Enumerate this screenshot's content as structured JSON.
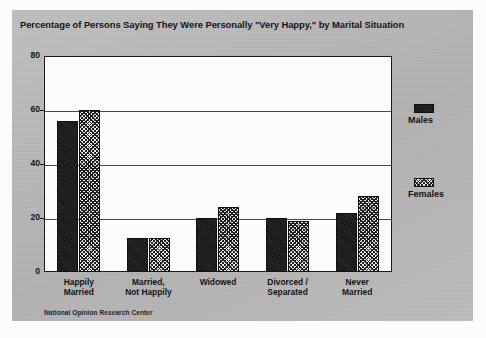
{
  "chart_data": {
    "type": "bar",
    "title": "Percentage of Persons Saying They Were Personally \"Very Happy,\" by Marital Situation",
    "xlabel": "",
    "ylabel": "",
    "ylim": [
      0,
      80
    ],
    "yticks": [
      "0",
      "20",
      "40",
      "60",
      "80"
    ],
    "ytick_values": [
      0,
      20,
      40,
      60,
      80
    ],
    "grid": true,
    "grid_axis": "y",
    "legend_position": "right",
    "categories": [
      "Happily\nMarried",
      "Married,\nNot Happily",
      "Widowed",
      "Divorced /\nSeparated",
      "Never\nMarried"
    ],
    "series": [
      {
        "name": "Males",
        "color": "#1b1b1b",
        "pattern": "solid",
        "values": [
          56,
          12.5,
          20,
          20,
          22
        ]
      },
      {
        "name": "Females",
        "color": "#ededed",
        "pattern": "hatched",
        "values": [
          60,
          12.5,
          24,
          19,
          28
        ]
      }
    ],
    "annotations": [
      "National Opinion Research Center"
    ]
  },
  "figure": {
    "title": "Percentage of Persons Saying They Were Personally \"Very Happy,\" by Marital Situation",
    "source_note": "National Opinion Research Center",
    "panel_color": "#b9b9b9",
    "plot_background": "#ffffff",
    "axis_color": "#1a1a1a"
  },
  "axis": {
    "y_ticks": [
      {
        "label": "80",
        "value": 80
      },
      {
        "label": "60",
        "value": 60
      },
      {
        "label": "40",
        "value": 40
      },
      {
        "label": "20",
        "value": 20
      },
      {
        "label": "0",
        "value": 0
      }
    ],
    "x_categories": [
      {
        "line1": "Happily",
        "line2": "Married"
      },
      {
        "line1": "Married,",
        "line2": "Not Happily"
      },
      {
        "line1": "Widowed",
        "line2": ""
      },
      {
        "line1": "Divorced /",
        "line2": "Separated"
      },
      {
        "line1": "Never",
        "line2": "Married"
      }
    ]
  },
  "legend": {
    "entries": [
      {
        "label": "Males",
        "pattern": "solid"
      },
      {
        "label": "Females",
        "pattern": "hatched"
      }
    ]
  }
}
